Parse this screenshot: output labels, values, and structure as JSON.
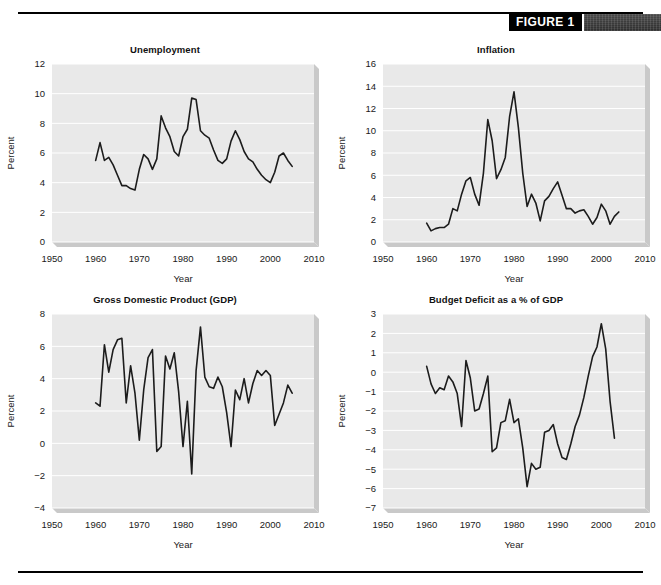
{
  "figure": {
    "label": "FIGURE 1",
    "swatch_color": "#3a3a3a",
    "rule_color": "#000000"
  },
  "axis_common": {
    "xlabel": "Year",
    "ylabel": "Percent",
    "xticks": [
      1950,
      1960,
      1970,
      1980,
      1990,
      2000,
      2010
    ],
    "xlim": [
      1950,
      2010
    ]
  },
  "chart_data": [
    {
      "type": "line",
      "id": "unemployment",
      "title": "Unemployment",
      "xlabel": "Year",
      "ylabel": "Percent",
      "xlim": [
        1950,
        2010
      ],
      "ylim": [
        0,
        12
      ],
      "yticks": [
        0,
        2,
        4,
        6,
        8,
        10,
        12
      ],
      "xticks": [
        1950,
        1960,
        1970,
        1980,
        1990,
        2000,
        2010
      ],
      "grid": true,
      "line_color": "#1c1c1c",
      "x": [
        1960,
        1961,
        1962,
        1963,
        1964,
        1965,
        1966,
        1967,
        1968,
        1969,
        1970,
        1971,
        1972,
        1973,
        1974,
        1975,
        1976,
        1977,
        1978,
        1979,
        1980,
        1981,
        1982,
        1983,
        1984,
        1985,
        1986,
        1987,
        1988,
        1989,
        1990,
        1991,
        1992,
        1993,
        1994,
        1995,
        1996,
        1997,
        1998,
        1999,
        2000,
        2001,
        2002,
        2003,
        2004,
        2005
      ],
      "values": [
        5.5,
        6.7,
        5.5,
        5.7,
        5.2,
        4.5,
        3.8,
        3.8,
        3.6,
        3.5,
        4.9,
        5.9,
        5.6,
        4.9,
        5.6,
        8.5,
        7.7,
        7.1,
        6.1,
        5.8,
        7.1,
        7.6,
        9.7,
        9.6,
        7.5,
        7.2,
        7.0,
        6.2,
        5.5,
        5.3,
        5.6,
        6.8,
        7.5,
        6.9,
        6.1,
        5.6,
        5.4,
        4.9,
        4.5,
        4.2,
        4.0,
        4.7,
        5.8,
        6.0,
        5.5,
        5.1
      ]
    },
    {
      "type": "line",
      "id": "inflation",
      "title": "Inflation",
      "xlabel": "Year",
      "ylabel": "Percent",
      "xlim": [
        1950,
        2010
      ],
      "ylim": [
        0,
        16
      ],
      "yticks": [
        0,
        2,
        4,
        6,
        8,
        10,
        12,
        14,
        16
      ],
      "xticks": [
        1950,
        1960,
        1970,
        1980,
        1990,
        2000,
        2010
      ],
      "grid": true,
      "line_color": "#1c1c1c",
      "x": [
        1960,
        1961,
        1962,
        1963,
        1964,
        1965,
        1966,
        1967,
        1968,
        1969,
        1970,
        1971,
        1972,
        1973,
        1974,
        1975,
        1976,
        1977,
        1978,
        1979,
        1980,
        1981,
        1982,
        1983,
        1984,
        1985,
        1986,
        1987,
        1988,
        1989,
        1990,
        1991,
        1992,
        1993,
        1994,
        1995,
        1996,
        1997,
        1998,
        1999,
        2000,
        2001,
        2002,
        2003,
        2004
      ],
      "values": [
        1.7,
        1.0,
        1.2,
        1.3,
        1.3,
        1.6,
        3.0,
        2.8,
        4.3,
        5.5,
        5.8,
        4.3,
        3.3,
        6.2,
        11.0,
        9.1,
        5.7,
        6.5,
        7.6,
        11.3,
        13.5,
        10.3,
        6.2,
        3.2,
        4.3,
        3.5,
        1.9,
        3.7,
        4.1,
        4.8,
        5.4,
        4.2,
        3.0,
        3.0,
        2.6,
        2.8,
        2.9,
        2.3,
        1.6,
        2.2,
        3.4,
        2.8,
        1.6,
        2.3,
        2.7
      ]
    },
    {
      "type": "line",
      "id": "gdp",
      "title": "Gross Domestic Product (GDP)",
      "xlabel": "Year",
      "ylabel": "Percent",
      "xlim": [
        1950,
        2010
      ],
      "ylim": [
        -4,
        8
      ],
      "yticks": [
        -4,
        -2,
        0,
        2,
        4,
        6,
        8
      ],
      "xticks": [
        1950,
        1960,
        1970,
        1980,
        1990,
        2000,
        2010
      ],
      "grid": true,
      "line_color": "#1c1c1c",
      "x": [
        1960,
        1961,
        1962,
        1963,
        1964,
        1965,
        1966,
        1967,
        1968,
        1969,
        1970,
        1971,
        1972,
        1973,
        1974,
        1975,
        1976,
        1977,
        1978,
        1979,
        1980,
        1981,
        1982,
        1983,
        1984,
        1985,
        1986,
        1987,
        1988,
        1989,
        1990,
        1991,
        1992,
        1993,
        1994,
        1995,
        1996,
        1997,
        1998,
        1999,
        2000,
        2001,
        2002,
        2003,
        2004,
        2005
      ],
      "values": [
        2.5,
        2.3,
        6.1,
        4.4,
        5.8,
        6.4,
        6.5,
        2.5,
        4.8,
        3.1,
        0.2,
        3.3,
        5.3,
        5.8,
        -0.5,
        -0.2,
        5.4,
        4.6,
        5.6,
        3.2,
        -0.2,
        2.6,
        -1.9,
        4.5,
        7.2,
        4.1,
        3.5,
        3.4,
        4.1,
        3.5,
        1.9,
        -0.2,
        3.3,
        2.7,
        4.0,
        2.5,
        3.7,
        4.5,
        4.2,
        4.5,
        4.2,
        1.1,
        1.8,
        2.5,
        3.6,
        3.1
      ]
    },
    {
      "type": "line",
      "id": "budget-deficit",
      "title": "Budget Deficit as a % of GDP",
      "xlabel": "Year",
      "ylabel": "Percent",
      "xlim": [
        1950,
        2010
      ],
      "ylim": [
        -7,
        3
      ],
      "yticks": [
        -7,
        -6,
        -5,
        -4,
        -3,
        -2,
        -1,
        0,
        1,
        2,
        3
      ],
      "xticks": [
        1950,
        1960,
        1970,
        1980,
        1990,
        2000,
        2010
      ],
      "grid": true,
      "line_color": "#1c1c1c",
      "x": [
        1960,
        1961,
        1962,
        1963,
        1964,
        1965,
        1966,
        1967,
        1968,
        1969,
        1970,
        1971,
        1972,
        1973,
        1974,
        1975,
        1976,
        1977,
        1978,
        1979,
        1980,
        1981,
        1982,
        1983,
        1984,
        1985,
        1986,
        1987,
        1988,
        1989,
        1990,
        1991,
        1992,
        1993,
        1994,
        1995,
        1996,
        1997,
        1998,
        1999,
        2000,
        2001,
        2002,
        2003
      ],
      "values": [
        0.3,
        -0.6,
        -1.1,
        -0.8,
        -0.9,
        -0.2,
        -0.5,
        -1.1,
        -2.8,
        0.6,
        -0.3,
        -2.0,
        -1.9,
        -1.1,
        -0.2,
        -4.1,
        -3.9,
        -2.6,
        -2.5,
        -1.4,
        -2.6,
        -2.4,
        -3.9,
        -5.9,
        -4.7,
        -5.0,
        -4.9,
        -3.1,
        -3.0,
        -2.7,
        -3.7,
        -4.4,
        -4.5,
        -3.7,
        -2.8,
        -2.2,
        -1.3,
        -0.2,
        0.8,
        1.3,
        2.5,
        1.2,
        -1.5,
        -3.4
      ]
    }
  ]
}
